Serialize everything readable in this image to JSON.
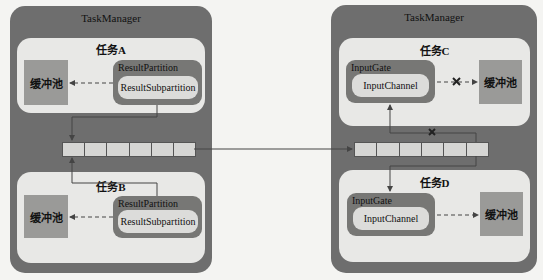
{
  "left_taskmanager": {
    "title": "TaskManager",
    "task_a": {
      "title": "任务A",
      "buffer_pool": "缓冲池",
      "result_partition": "ResultPartition",
      "result_subpartition": "ResultSubpartition"
    },
    "task_b": {
      "title": "任务B",
      "buffer_pool": "缓冲池",
      "result_partition": "ResultPartition",
      "result_subpartition": "ResultSubpartition"
    },
    "queue_slots": 6
  },
  "right_taskmanager": {
    "title": "TaskManager",
    "task_c": {
      "title": "任务C",
      "input_gate": "InputGate",
      "input_channel": "InputChannel",
      "buffer_pool": "缓冲池",
      "blocked_marker": "✕"
    },
    "task_d": {
      "title": "任务D",
      "input_gate": "InputGate",
      "input_channel": "InputChannel",
      "buffer_pool": "缓冲池"
    },
    "queue_slots": 6,
    "blocked_marker": "✕"
  },
  "colors": {
    "background": "#f4f4f2",
    "taskmanager": "#6e6e6e",
    "task": "#e8e8e6",
    "buffer_pool": "#9a9a98",
    "partition": "#777775",
    "pill": "#dcdcda",
    "queue": "#d6d6d4",
    "line": "#444444"
  }
}
